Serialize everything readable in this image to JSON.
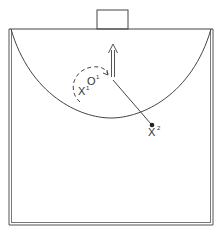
{
  "diagram": {
    "type": "handball-play-diagram",
    "colors": {
      "line": "#444444",
      "background": "#ffffff"
    },
    "players": [
      {
        "id": "X1",
        "symbol": "X",
        "number": "1",
        "role": "defender"
      },
      {
        "id": "O1",
        "symbol": "O",
        "number": "1",
        "role": "attacker"
      },
      {
        "id": "X2",
        "symbol": "X",
        "number": "2",
        "role": "defender"
      }
    ],
    "labels": {
      "x1_symbol": "X",
      "x1_number": "1",
      "o1_symbol": "O",
      "o1_number": "1",
      "x2_symbol": "X",
      "x2_number": "2"
    }
  }
}
